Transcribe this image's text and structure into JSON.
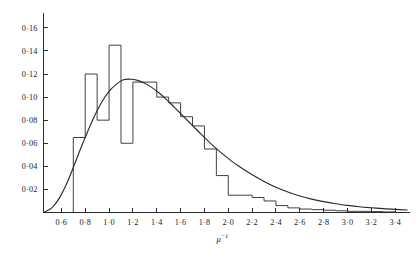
{
  "figure": {
    "name": "histogram-with-fitted-curve",
    "caption": ""
  },
  "axes": {
    "y": {
      "title": "",
      "tick_labels": [
        "0·02",
        "0·04",
        "0·06",
        "0·08",
        "0·10",
        "0·12",
        "0·14",
        "0·16"
      ],
      "tick_values": [
        0.02,
        0.04,
        0.06,
        0.08,
        0.1,
        0.12,
        0.14,
        0.16
      ],
      "min": 0,
      "max": 0.172
    },
    "x": {
      "title_base": "μ",
      "title_sup": "−1",
      "tick_labels": [
        "0·6",
        "0·8",
        "1·0",
        "1·2",
        "1·4",
        "1·6",
        "1·8",
        "2·0",
        "2·2",
        "2·4",
        "2·6",
        "2·8",
        "3·0",
        "3·2",
        "3·4"
      ],
      "tick_values": [
        0.6,
        0.8,
        1.0,
        1.2,
        1.4,
        1.6,
        1.8,
        2.0,
        2.2,
        2.4,
        2.6,
        2.8,
        3.0,
        3.2,
        3.4
      ],
      "min": 0.45,
      "max": 3.52
    }
  },
  "colors": {
    "ink": "#2b2b2b",
    "background": "#ffffff"
  },
  "chart_data": {
    "type": "bar",
    "title": "",
    "subtitle": "",
    "xlabel": "μ⁻¹",
    "ylabel": "",
    "xlim": [
      0.45,
      3.52
    ],
    "ylim": [
      0,
      0.172
    ],
    "grid": false,
    "legend": null,
    "bin_width": 0.1,
    "series": [
      {
        "name": "histogram",
        "kind": "step-outline",
        "bin_edges": [
          0.7,
          0.8,
          0.9,
          1.0,
          1.1,
          1.2,
          1.3,
          1.4,
          1.5,
          1.6,
          1.7,
          1.8,
          1.9,
          2.0,
          2.1,
          2.2,
          2.3,
          2.4,
          2.5,
          2.6,
          2.7,
          2.8,
          2.9,
          3.0,
          3.1,
          3.2,
          3.3,
          3.4
        ],
        "values": [
          0.065,
          0.12,
          0.08,
          0.145,
          0.06,
          0.113,
          0.113,
          0.1,
          0.095,
          0.083,
          0.075,
          0.055,
          0.032,
          0.015,
          0.015,
          0.013,
          0.01,
          0.006,
          0.004,
          0.003,
          0.0025,
          0.002,
          0.0015,
          0.001,
          0.001,
          0.0008,
          0.0005
        ]
      },
      {
        "name": "fitted-curve",
        "kind": "line",
        "x": [
          0.46,
          0.52,
          0.58,
          0.64,
          0.7,
          0.76,
          0.82,
          0.88,
          0.94,
          1.0,
          1.06,
          1.12,
          1.18,
          1.24,
          1.3,
          1.36,
          1.42,
          1.48,
          1.54,
          1.6,
          1.66,
          1.72,
          1.78,
          1.84,
          1.9,
          1.96,
          2.02,
          2.08,
          2.14,
          2.2,
          2.3,
          2.4,
          2.5,
          2.6,
          2.7,
          2.8,
          2.9,
          3.0,
          3.1,
          3.2,
          3.3,
          3.4,
          3.5
        ],
        "y": [
          0.0005,
          0.004,
          0.012,
          0.024,
          0.039,
          0.055,
          0.07,
          0.084,
          0.096,
          0.105,
          0.111,
          0.115,
          0.1155,
          0.1145,
          0.112,
          0.1082,
          0.1035,
          0.098,
          0.092,
          0.0858,
          0.0795,
          0.0732,
          0.067,
          0.061,
          0.0554,
          0.0501,
          0.0452,
          0.0407,
          0.0366,
          0.0328,
          0.0268,
          0.0218,
          0.0177,
          0.0143,
          0.0116,
          0.0094,
          0.0076,
          0.0062,
          0.005,
          0.0041,
          0.0033,
          0.0027,
          0.0022
        ]
      }
    ]
  }
}
